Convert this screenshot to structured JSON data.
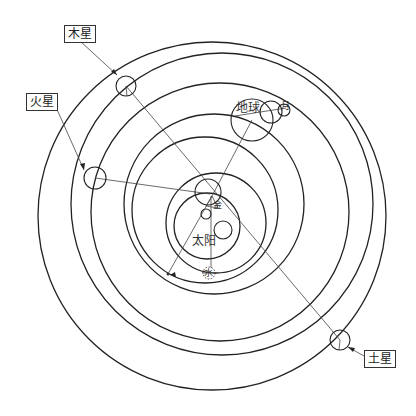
{
  "diagram": {
    "type": "orbital-diagram",
    "labels": {
      "jupiter": "木星",
      "mars": "火星",
      "earth": "地球",
      "saturn": "土星",
      "sun": "太阳",
      "moon": "月",
      "mercury": "水",
      "venus": "金"
    },
    "orbits": [
      {
        "cx": 212,
        "cy": 216,
        "r": 174
      },
      {
        "cx": 222,
        "cy": 204,
        "r": 151
      },
      {
        "cx": 220,
        "cy": 212,
        "r": 129
      },
      {
        "cx": 214,
        "cy": 204,
        "r": 90
      },
      {
        "cx": 205,
        "cy": 210,
        "r": 73
      },
      {
        "cx": 216,
        "cy": 223,
        "r": 50
      },
      {
        "cx": 207,
        "cy": 226,
        "r": 33
      }
    ],
    "planets": [
      {
        "name": "jupiter",
        "cx": 126,
        "cy": 86,
        "r": 10
      },
      {
        "name": "mars",
        "cx": 95,
        "cy": 178,
        "r": 11
      },
      {
        "name": "earth",
        "cx": 252,
        "cy": 120,
        "r": 21
      },
      {
        "name": "earth-epicycle",
        "cx": 271,
        "cy": 112,
        "r": 11
      },
      {
        "name": "moon",
        "cx": 284,
        "cy": 110,
        "r": 6
      },
      {
        "name": "saturn",
        "cx": 340,
        "cy": 340,
        "r": 10
      },
      {
        "name": "sun-epicycle",
        "cx": 208,
        "cy": 192,
        "r": 13
      },
      {
        "name": "mercury",
        "cx": 206,
        "cy": 214,
        "r": 5
      },
      {
        "name": "venus",
        "cx": 223,
        "cy": 230,
        "r": 9
      },
      {
        "name": "dashed-body",
        "cx": 209,
        "cy": 273,
        "r": 6
      }
    ]
  }
}
